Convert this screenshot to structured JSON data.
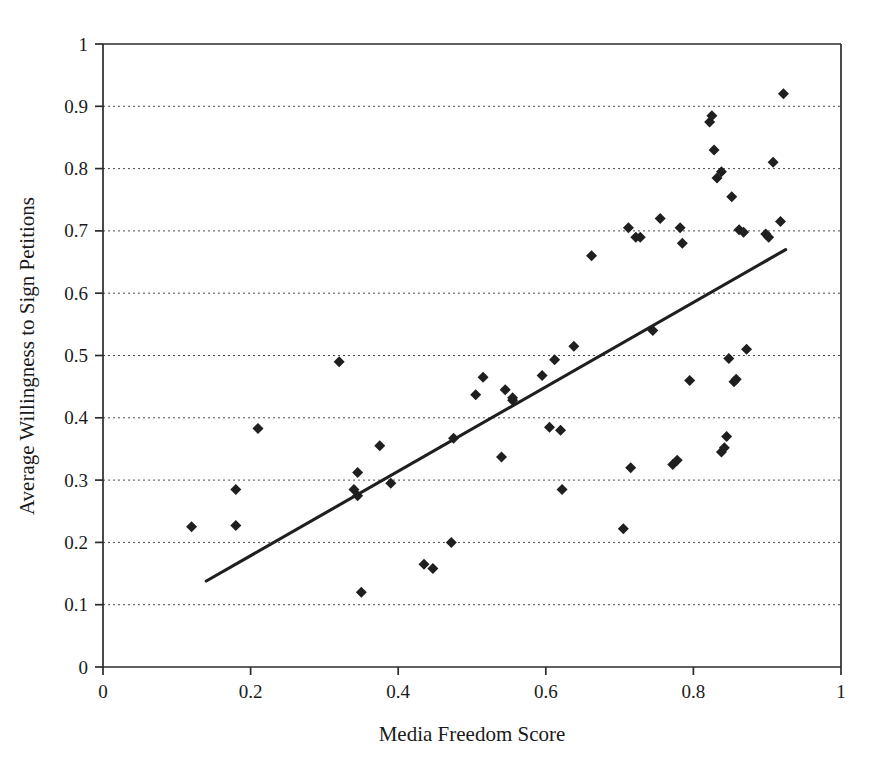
{
  "chart_data": {
    "type": "scatter",
    "title": "",
    "xlabel": "Media Freedom Score",
    "ylabel": "Average Willingness to Sign Petitions",
    "xlim": [
      0,
      1
    ],
    "ylim": [
      0,
      1
    ],
    "xticks": [
      "0",
      "0.2",
      "0.4",
      "0.6",
      "0.8",
      "1"
    ],
    "xtick_values": [
      0,
      0.2,
      0.4,
      0.6,
      0.8,
      1
    ],
    "yticks": [
      "0",
      "0.1",
      "0.2",
      "0.3",
      "0.4",
      "0.5",
      "0.6",
      "0.7",
      "0.8",
      "0.9",
      "1"
    ],
    "ytick_values": [
      0,
      0.1,
      0.2,
      0.3,
      0.4,
      0.5,
      0.6,
      0.7,
      0.8,
      0.9,
      1
    ],
    "grid": "horizontal-dotted",
    "legend": "none",
    "marker": "diamond",
    "marker_color": "#1f1f1f",
    "marker_size": 11,
    "series": [
      {
        "name": "Countries",
        "points": [
          [
            0.12,
            0.225
          ],
          [
            0.18,
            0.227
          ],
          [
            0.18,
            0.285
          ],
          [
            0.21,
            0.383
          ],
          [
            0.32,
            0.49
          ],
          [
            0.34,
            0.285
          ],
          [
            0.345,
            0.275
          ],
          [
            0.345,
            0.312
          ],
          [
            0.35,
            0.12
          ],
          [
            0.375,
            0.355
          ],
          [
            0.39,
            0.295
          ],
          [
            0.435,
            0.165
          ],
          [
            0.447,
            0.158
          ],
          [
            0.472,
            0.2
          ],
          [
            0.475,
            0.367
          ],
          [
            0.505,
            0.437
          ],
          [
            0.515,
            0.465
          ],
          [
            0.54,
            0.337
          ],
          [
            0.545,
            0.445
          ],
          [
            0.555,
            0.428
          ],
          [
            0.555,
            0.432
          ],
          [
            0.595,
            0.468
          ],
          [
            0.605,
            0.385
          ],
          [
            0.612,
            0.493
          ],
          [
            0.62,
            0.38
          ],
          [
            0.622,
            0.285
          ],
          [
            0.638,
            0.515
          ],
          [
            0.662,
            0.66
          ],
          [
            0.705,
            0.222
          ],
          [
            0.712,
            0.705
          ],
          [
            0.715,
            0.32
          ],
          [
            0.722,
            0.69
          ],
          [
            0.728,
            0.69
          ],
          [
            0.745,
            0.54
          ],
          [
            0.755,
            0.72
          ],
          [
            0.772,
            0.325
          ],
          [
            0.778,
            0.332
          ],
          [
            0.782,
            0.705
          ],
          [
            0.785,
            0.68
          ],
          [
            0.795,
            0.46
          ],
          [
            0.822,
            0.875
          ],
          [
            0.825,
            0.885
          ],
          [
            0.828,
            0.83
          ],
          [
            0.832,
            0.785
          ],
          [
            0.838,
            0.795
          ],
          [
            0.838,
            0.345
          ],
          [
            0.842,
            0.352
          ],
          [
            0.845,
            0.37
          ],
          [
            0.848,
            0.495
          ],
          [
            0.852,
            0.755
          ],
          [
            0.855,
            0.458
          ],
          [
            0.858,
            0.462
          ],
          [
            0.862,
            0.702
          ],
          [
            0.868,
            0.698
          ],
          [
            0.872,
            0.51
          ],
          [
            0.898,
            0.695
          ],
          [
            0.902,
            0.69
          ],
          [
            0.908,
            0.81
          ],
          [
            0.918,
            0.715
          ],
          [
            0.922,
            0.92
          ]
        ]
      }
    ],
    "trendline": {
      "name": "Linear fit",
      "x_start": 0.14,
      "y_start": 0.138,
      "x_end": 0.925,
      "y_end": 0.67,
      "color": "#1f1f1f"
    }
  }
}
